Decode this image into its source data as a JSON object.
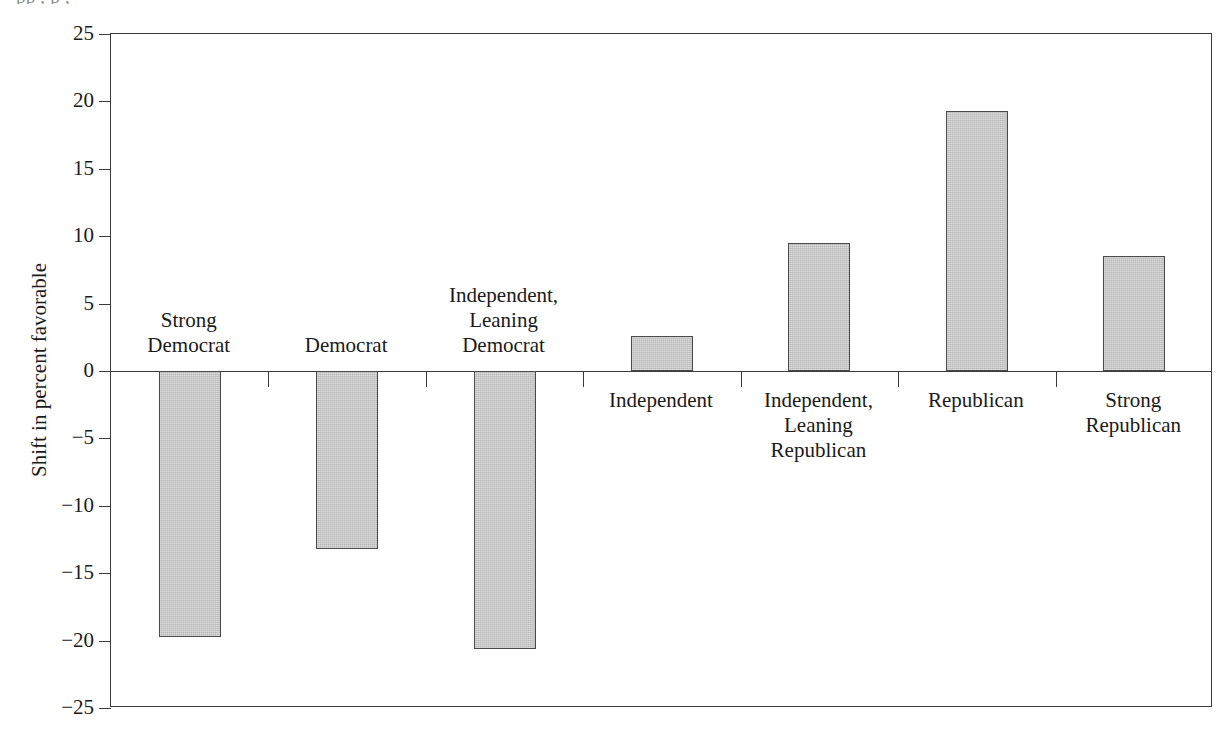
{
  "figure": {
    "cropped_caption": "pp   , p  ,",
    "ylabel": "Shift in percent favorable"
  },
  "chart_data": {
    "type": "bar",
    "title": "",
    "subtitle": "",
    "xlabel": "",
    "ylabel": "Shift in percent favorable",
    "ylim": [
      -25,
      25
    ],
    "yticks": [
      25,
      20,
      15,
      10,
      5,
      0,
      -5,
      -10,
      -15,
      -20,
      -25
    ],
    "ytick_labels": [
      "25",
      "20",
      "15",
      "10",
      "5",
      "0",
      "−5",
      "−10",
      "−15",
      "−20",
      "−25"
    ],
    "grid": false,
    "legend": null,
    "bar_color": "#b9b9b9",
    "bar_edge_color": "#4a4a4a",
    "categories": [
      "Strong\nDemocrat",
      "Democrat",
      "Independent,\nLeaning\nDemocrat",
      "Independent",
      "Independent,\nLeaning\nRepublican",
      "Republican",
      "Strong\nRepublican"
    ],
    "values": [
      -19.7,
      -13.2,
      -20.6,
      2.6,
      9.5,
      19.3,
      8.5
    ],
    "series": [
      {
        "name": "Shift in percent favorable",
        "values": [
          -19.7,
          -13.2,
          -20.6,
          2.6,
          9.5,
          19.3,
          8.5
        ]
      }
    ]
  }
}
